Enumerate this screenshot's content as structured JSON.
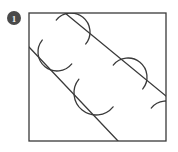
{
  "figure": {
    "label_badge": {
      "icon": "filled-circle-badge-icon",
      "text": "1",
      "fill_color": "#4a4a4a",
      "text_color": "#f2f2f2",
      "center_x": 14,
      "center_y": 18,
      "radius": 7
    },
    "background_color": "#ffffff",
    "stroke_color": "#3a3a3a",
    "square": {
      "name": "outer-square",
      "x": 29,
      "y": 13,
      "width": 137,
      "height": 128,
      "stroke_width": 1.3
    },
    "diagonals": [
      {
        "name": "upper-diagonal-line",
        "x1": 65,
        "y1": 13,
        "x2": 166,
        "y2": 96,
        "stroke_width": 1.3
      },
      {
        "name": "lower-diagonal-line",
        "x1": 29,
        "y1": 47,
        "x2": 118,
        "y2": 141,
        "stroke_width": 1.3
      }
    ],
    "arcs": [
      {
        "name": "arc-1-upper-left",
        "cx": 71,
        "cy": 32,
        "r": 19,
        "start_angle": 219,
        "sweep": 180,
        "side": "below-left"
      },
      {
        "name": "arc-2-upper-right",
        "cx": 128,
        "cy": 77,
        "r": 19,
        "start_angle": 219,
        "sweep": 180,
        "side": "below-left"
      },
      {
        "name": "arc-3-lower-left",
        "cx": 57,
        "cy": 52,
        "r": 19,
        "start_angle": 39,
        "sweep": 180,
        "side": "above-right"
      },
      {
        "name": "arc-4-lower-right",
        "cx": 96,
        "cy": 93,
        "r": 22,
        "start_angle": 39,
        "sweep": 180,
        "side": "above-right"
      },
      {
        "name": "arc-5-right-edge",
        "cx": 166,
        "cy": 120,
        "r": 19,
        "start_angle": 219,
        "sweep": 180,
        "side": "below-left"
      }
    ]
  }
}
